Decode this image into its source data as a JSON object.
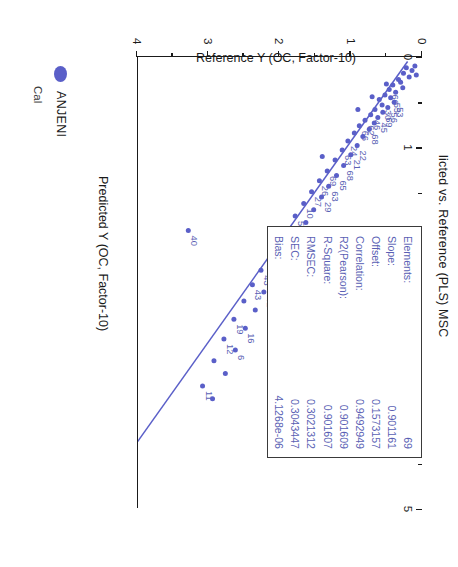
{
  "chart_data": {
    "type": "scatter",
    "title_visible": "licted vs. Reference (PLS) MSC",
    "xlabel": "Predicted Y (OC, Factor-10)",
    "ylabel": "Reference Y (OC, Factor-10)",
    "xlim": [
      0,
      5
    ],
    "ylim": [
      0,
      4
    ],
    "xticks": [
      0,
      1,
      2,
      3,
      4,
      5
    ],
    "xticklabels": [
      "0",
      "1",
      "2",
      "3",
      "4",
      "5"
    ],
    "yticks": [
      0,
      1,
      2,
      3,
      4
    ],
    "yticklabels": [
      "0",
      "1",
      "2",
      "3",
      "4"
    ],
    "grid": false,
    "legend_position": "bottom-left",
    "fit_line": {
      "slope": 0.901161,
      "offset": 0.1573157,
      "x_start": 0.05,
      "x_end": 4.6
    },
    "series": [
      {
        "name": "ANJENI",
        "color": "#5a5fc8",
        "points": [
          {
            "x": 0.1,
            "y": 0.1,
            "label": ""
          },
          {
            "x": 0.12,
            "y": 0.22,
            "label": ""
          },
          {
            "x": 0.15,
            "y": 0.14,
            "label": ""
          },
          {
            "x": 0.18,
            "y": 0.26,
            "label": ""
          },
          {
            "x": 0.22,
            "y": 0.18,
            "label": ""
          },
          {
            "x": 0.25,
            "y": 0.33,
            "label": ""
          },
          {
            "x": 0.28,
            "y": 0.3,
            "label": ""
          },
          {
            "x": 0.31,
            "y": 0.41,
            "label": ""
          },
          {
            "x": 0.34,
            "y": 0.27,
            "label": ""
          },
          {
            "x": 0.36,
            "y": 0.46,
            "label": "60"
          },
          {
            "x": 0.39,
            "y": 0.37,
            "label": ""
          },
          {
            "x": 0.42,
            "y": 0.52,
            "label": ""
          },
          {
            "x": 0.45,
            "y": 0.44,
            "label": "55"
          },
          {
            "x": 0.47,
            "y": 0.6,
            "label": ""
          },
          {
            "x": 0.5,
            "y": 0.39,
            "label": "53"
          },
          {
            "x": 0.53,
            "y": 0.56,
            "label": "30"
          },
          {
            "x": 0.56,
            "y": 0.48,
            "label": "56"
          },
          {
            "x": 0.58,
            "y": 0.66,
            "label": ""
          },
          {
            "x": 0.61,
            "y": 0.55,
            "label": "69"
          },
          {
            "x": 0.64,
            "y": 0.72,
            "label": "46"
          },
          {
            "x": 0.67,
            "y": 0.62,
            "label": "45"
          },
          {
            "x": 0.7,
            "y": 0.8,
            "label": "62"
          },
          {
            "x": 0.73,
            "y": 0.67,
            "label": ""
          },
          {
            "x": 0.76,
            "y": 0.88,
            "label": "66"
          },
          {
            "x": 0.8,
            "y": 0.74,
            "label": "68"
          },
          {
            "x": 0.84,
            "y": 0.95,
            "label": ""
          },
          {
            "x": 0.88,
            "y": 0.83,
            "label": ""
          },
          {
            "x": 0.93,
            "y": 1.04,
            "label": "24"
          },
          {
            "x": 0.98,
            "y": 0.91,
            "label": "22"
          },
          {
            "x": 1.03,
            "y": 1.12,
            "label": "63"
          },
          {
            "x": 1.08,
            "y": 1.0,
            "label": "21"
          },
          {
            "x": 1.14,
            "y": 1.22,
            "label": ""
          },
          {
            "x": 1.2,
            "y": 1.1,
            "label": "68"
          },
          {
            "x": 1.26,
            "y": 1.33,
            "label": "69"
          },
          {
            "x": 1.31,
            "y": 1.2,
            "label": "65"
          },
          {
            "x": 1.37,
            "y": 1.44,
            "label": "26"
          },
          {
            "x": 1.43,
            "y": 1.31,
            "label": "63"
          },
          {
            "x": 1.49,
            "y": 1.55,
            "label": "27"
          },
          {
            "x": 1.55,
            "y": 1.41,
            "label": "29"
          },
          {
            "x": 1.62,
            "y": 1.66,
            "label": "10"
          },
          {
            "x": 1.69,
            "y": 1.52,
            "label": ""
          },
          {
            "x": 1.76,
            "y": 1.78,
            "label": "5"
          },
          {
            "x": 1.83,
            "y": 1.63,
            "label": ""
          },
          {
            "x": 1.9,
            "y": 1.9,
            "label": "6"
          },
          {
            "x": 1.97,
            "y": 1.74,
            "label": ""
          },
          {
            "x": 2.05,
            "y": 2.02,
            "label": "34"
          },
          {
            "x": 2.12,
            "y": 1.86,
            "label": "35"
          },
          {
            "x": 2.2,
            "y": 2.14,
            "label": "18"
          },
          {
            "x": 2.28,
            "y": 1.98,
            "label": "38"
          },
          {
            "x": 2.36,
            "y": 2.26,
            "label": "43"
          },
          {
            "x": 2.44,
            "y": 2.1,
            "label": "44"
          },
          {
            "x": 2.52,
            "y": 2.38,
            "label": "43"
          },
          {
            "x": 2.6,
            "y": 2.22,
            "label": "42"
          },
          {
            "x": 2.7,
            "y": 2.5,
            "label": ""
          },
          {
            "x": 2.8,
            "y": 2.34,
            "label": ""
          },
          {
            "x": 2.9,
            "y": 2.64,
            "label": "19"
          },
          {
            "x": 3.0,
            "y": 2.48,
            "label": "16"
          },
          {
            "x": 3.12,
            "y": 2.78,
            "label": "12"
          },
          {
            "x": 3.24,
            "y": 2.62,
            "label": "6"
          },
          {
            "x": 3.36,
            "y": 2.92,
            "label": ""
          },
          {
            "x": 3.5,
            "y": 2.76,
            "label": ""
          },
          {
            "x": 3.64,
            "y": 3.08,
            "label": "11"
          },
          {
            "x": 3.78,
            "y": 2.94,
            "label": ""
          },
          {
            "x": 1.92,
            "y": 3.28,
            "label": "40"
          },
          {
            "x": 0.2,
            "y": 0.08,
            "label": ""
          },
          {
            "x": 0.3,
            "y": 0.5,
            "label": ""
          },
          {
            "x": 0.44,
            "y": 0.7,
            "label": ""
          },
          {
            "x": 0.58,
            "y": 0.9,
            "label": ""
          },
          {
            "x": 1.1,
            "y": 1.4,
            "label": ""
          }
        ]
      }
    ]
  },
  "stats": {
    "rows": [
      {
        "key": "Elements:",
        "value": "69"
      },
      {
        "key": "Slope:",
        "value": "0.901161"
      },
      {
        "key": "Offset:",
        "value": "0.1573157"
      },
      {
        "key": "Correlation:",
        "value": "0.9492949"
      },
      {
        "key": "R2(Pearson):",
        "value": "0.901609"
      },
      {
        "key": "R-Square:",
        "value": "0.901607"
      },
      {
        "key": "RMSEC:",
        "value": "0.3021312"
      },
      {
        "key": "SEC:",
        "value": "0.3043447"
      },
      {
        "key": "Bias:",
        "value": "4.1268e-06"
      }
    ]
  },
  "legend": {
    "marker_color": "#5a5fc8",
    "label": "ANJENI",
    "sub_label": "Cal"
  },
  "colors": {
    "data": "#5a5fc8",
    "text": "#1b1b1b",
    "stats_text": "#5a5fb4",
    "axis": "#1a1a1a"
  }
}
